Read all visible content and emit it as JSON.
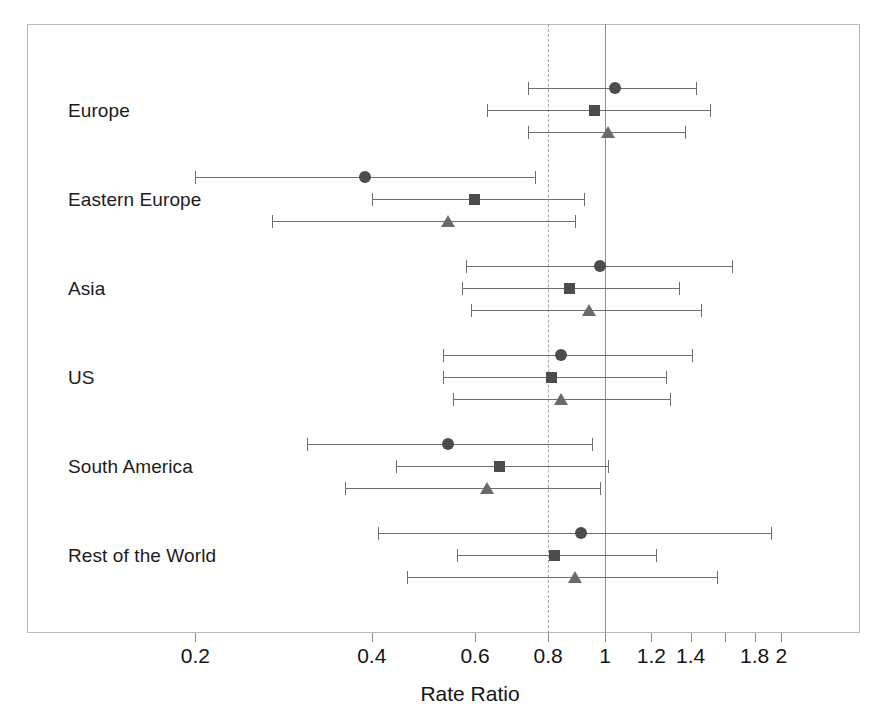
{
  "chart_data": {
    "type": "scatter",
    "subtype": "forest-plot",
    "title": "",
    "xlabel": "Rate Ratio",
    "ylabel": "",
    "xscale": "log",
    "xlim": [
      0.17,
      2.3
    ],
    "grid": false,
    "legend": "none",
    "reference_lines": [
      {
        "value": 0.8,
        "style": "dashed"
      },
      {
        "value": 1.0,
        "style": "solid"
      }
    ],
    "xticks": [
      0.2,
      0.4,
      0.6,
      0.8,
      1,
      1.2,
      1.4,
      1.6,
      1.8,
      2
    ],
    "xticklabels": [
      "0.2",
      "0.4",
      "0.6",
      "0.8",
      "1",
      "1.2",
      "1.4",
      "",
      "1.8",
      "2"
    ],
    "categories": [
      "Europe",
      "Eastern Europe",
      "Asia",
      "US",
      "South America",
      "Rest of the World"
    ],
    "series": [
      {
        "name": "circle",
        "marker": "circle",
        "color": "#4c4c4c",
        "values": [
          1.04,
          0.39,
          0.98,
          0.84,
          0.54,
          0.91
        ],
        "ci_low": [
          0.74,
          0.2,
          0.58,
          0.53,
          0.31,
          0.41
        ],
        "ci_high": [
          1.43,
          0.76,
          1.65,
          1.41,
          0.95,
          1.92
        ]
      },
      {
        "name": "square",
        "marker": "square",
        "color": "#4c4c4c",
        "values": [
          0.96,
          0.6,
          0.87,
          0.81,
          0.66,
          0.82
        ],
        "ci_low": [
          0.63,
          0.4,
          0.57,
          0.53,
          0.44,
          0.56
        ],
        "ci_high": [
          1.51,
          0.92,
          1.34,
          1.27,
          1.01,
          1.22
        ]
      },
      {
        "name": "triangle",
        "marker": "triangle",
        "color": "#6a6a6a",
        "values": [
          1.01,
          0.54,
          0.94,
          0.84,
          0.63,
          0.89
        ],
        "ci_low": [
          0.74,
          0.27,
          0.59,
          0.55,
          0.36,
          0.46
        ],
        "ci_high": [
          1.37,
          0.89,
          1.46,
          1.29,
          0.98,
          1.55
        ]
      }
    ]
  }
}
